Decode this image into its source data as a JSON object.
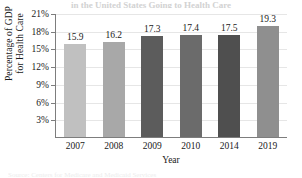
{
  "chart_data": {
    "type": "bar",
    "title": "in the United States Going to Health Care",
    "categories": [
      "2007",
      "2008",
      "2009",
      "2010",
      "2014",
      "2019"
    ],
    "values": [
      15.9,
      16.2,
      17.3,
      17.4,
      17.5,
      19.3
    ],
    "data_labels": [
      "15.9",
      "16.2",
      "17.3",
      "17.4",
      "17.5",
      "19.3"
    ],
    "xlabel": "Year",
    "ylabel": "Percentage of GDP for Health Care",
    "ylabel_line1": "Percentage of GDP",
    "ylabel_line2": "for Health Care",
    "ylim": [
      0,
      21
    ],
    "ytick_values": [
      3,
      6,
      9,
      12,
      15,
      18,
      21
    ],
    "ytick_labels": [
      "3%",
      "6%",
      "9%",
      "12%",
      "15%",
      "18%",
      "21%"
    ],
    "grid": true,
    "legend": "none",
    "bar_colors": [
      "#c0c0c0",
      "#a8a8a8",
      "#5c5c5c",
      "#6b6b6b",
      "#4f4f4f",
      "#8f8f8f"
    ],
    "axis_color": "#7d7d7d",
    "grid_color": "#e6e6e6"
  },
  "caption": {
    "bottom_strip": "Source:  Centers for Medicare and Medicaid Services"
  }
}
